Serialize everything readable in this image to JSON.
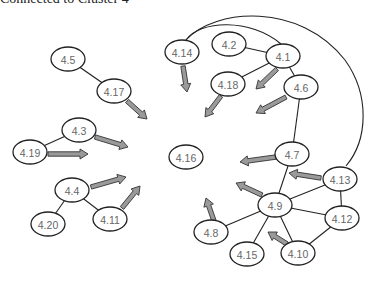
{
  "caption": "Connected to Cluster 4",
  "nodes": [
    {
      "id": "4.5",
      "label": "4.5",
      "cx": 68,
      "cy": 59
    },
    {
      "id": "4.17",
      "label": "4.17",
      "cx": 114,
      "cy": 91
    },
    {
      "id": "4.3",
      "label": "4.3",
      "cx": 79,
      "cy": 130
    },
    {
      "id": "4.19",
      "label": "4.19",
      "cx": 30,
      "cy": 152
    },
    {
      "id": "4.4",
      "label": "4.4",
      "cx": 72,
      "cy": 190
    },
    {
      "id": "4.20",
      "label": "4.20",
      "cx": 48,
      "cy": 224
    },
    {
      "id": "4.11",
      "label": "4.11",
      "cx": 110,
      "cy": 219
    },
    {
      "id": "4.14",
      "label": "4.14",
      "cx": 182,
      "cy": 52
    },
    {
      "id": "4.2",
      "label": "4.2",
      "cx": 229,
      "cy": 44
    },
    {
      "id": "4.1",
      "label": "4.1",
      "cx": 283,
      "cy": 56
    },
    {
      "id": "4.18",
      "label": "4.18",
      "cx": 228,
      "cy": 84
    },
    {
      "id": "4.6",
      "label": "4.6",
      "cx": 301,
      "cy": 87
    },
    {
      "id": "4.16",
      "label": "4.16",
      "cx": 186,
      "cy": 157
    },
    {
      "id": "4.7",
      "label": "4.7",
      "cx": 292,
      "cy": 154
    },
    {
      "id": "4.13",
      "label": "4.13",
      "cx": 340,
      "cy": 179
    },
    {
      "id": "4.9",
      "label": "4.9",
      "cx": 275,
      "cy": 205
    },
    {
      "id": "4.12",
      "label": "4.12",
      "cx": 342,
      "cy": 218
    },
    {
      "id": "4.8",
      "label": "4.8",
      "cx": 211,
      "cy": 232
    },
    {
      "id": "4.15",
      "label": "4.15",
      "cx": 247,
      "cy": 254
    },
    {
      "id": "4.10",
      "label": "4.10",
      "cx": 298,
      "cy": 253
    }
  ],
  "edges": [
    [
      "4.5",
      "4.17"
    ],
    [
      "4.3",
      "4.19"
    ],
    [
      "4.4",
      "4.20"
    ],
    [
      "4.4",
      "4.11"
    ],
    [
      "4.2",
      "4.1"
    ],
    [
      "4.1",
      "4.18"
    ],
    [
      "4.1",
      "4.6"
    ],
    [
      "4.6",
      "4.7"
    ],
    [
      "4.7",
      "4.9"
    ],
    [
      "4.9",
      "4.13"
    ],
    [
      "4.9",
      "4.12"
    ],
    [
      "4.9",
      "4.8"
    ],
    [
      "4.9",
      "4.15"
    ],
    [
      "4.9",
      "4.10"
    ],
    [
      "4.13",
      "4.12"
    ],
    [
      "4.12",
      "4.10"
    ]
  ],
  "curves": [
    {
      "from": "4.14",
      "to": "4.1",
      "d": "M 186 40 C 200 20, 250 18, 281 44"
    },
    {
      "from": "4.14",
      "to": "4.13",
      "d": "M 186 40 C 215 8, 300 2, 345 60 C 370 95, 368 140, 346 166"
    }
  ],
  "arrows": [
    {
      "from": "4.17",
      "x1": 127,
      "y1": 101,
      "x2": 147,
      "y2": 119
    },
    {
      "from": "4.3",
      "x1": 95,
      "y1": 137,
      "x2": 128,
      "y2": 147
    },
    {
      "from": "4.19",
      "x1": 48,
      "y1": 154,
      "x2": 88,
      "y2": 154
    },
    {
      "from": "4.4",
      "x1": 91,
      "y1": 187,
      "x2": 126,
      "y2": 177
    },
    {
      "from": "4.11",
      "x1": 122,
      "y1": 208,
      "x2": 140,
      "y2": 186
    },
    {
      "from": "4.14",
      "x1": 183,
      "y1": 66,
      "x2": 187,
      "y2": 92
    },
    {
      "from": "4.18",
      "x1": 221,
      "y1": 96,
      "x2": 205,
      "y2": 117
    },
    {
      "from": "4.1",
      "x1": 277,
      "y1": 69,
      "x2": 256,
      "y2": 89
    },
    {
      "from": "4.6",
      "x1": 286,
      "y1": 97,
      "x2": 256,
      "y2": 113
    },
    {
      "from": "4.7",
      "x1": 276,
      "y1": 157,
      "x2": 240,
      "y2": 162
    },
    {
      "from": "4.13",
      "x1": 321,
      "y1": 178,
      "x2": 289,
      "y2": 173
    },
    {
      "from": "4.9",
      "x1": 262,
      "y1": 195,
      "x2": 236,
      "y2": 183
    },
    {
      "from": "4.8",
      "x1": 214,
      "y1": 221,
      "x2": 206,
      "y2": 198
    },
    {
      "from": "4.10",
      "x1": 287,
      "y1": 244,
      "x2": 268,
      "y2": 232
    }
  ]
}
